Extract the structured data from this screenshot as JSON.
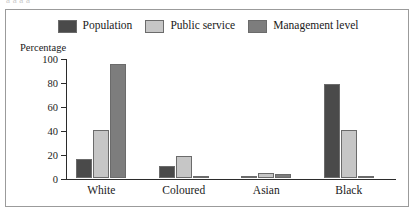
{
  "cut_text_top": "a   a                    a                                        a",
  "chart_data": {
    "type": "bar",
    "title": "",
    "subtitle": "",
    "xlabel": "",
    "ylabel": "Percentage",
    "ylim": [
      0,
      100
    ],
    "yticks": [
      0,
      20,
      40,
      60,
      80,
      100
    ],
    "ytick_labels": [
      "0",
      "20",
      "40",
      "60",
      "80",
      "100"
    ],
    "grid": false,
    "legend_position": "top-center",
    "categories": [
      "White",
      "Coloured",
      "Asian",
      "Black"
    ],
    "series": [
      {
        "name": "Population",
        "color": "#4a4a4a",
        "values": [
          16,
          10,
          2,
          78
        ]
      },
      {
        "name": "Public service",
        "color": "#c6c6c6",
        "values": [
          40,
          18,
          4,
          40
        ]
      },
      {
        "name": "Management level",
        "color": "#7d7d7d",
        "values": [
          95,
          2,
          3,
          2
        ]
      }
    ]
  },
  "style": {
    "frame_border": "#9b9b9b",
    "axis_color": "#2b2b2b",
    "text_color": "#1a1a1a",
    "background": "#ffffff"
  }
}
